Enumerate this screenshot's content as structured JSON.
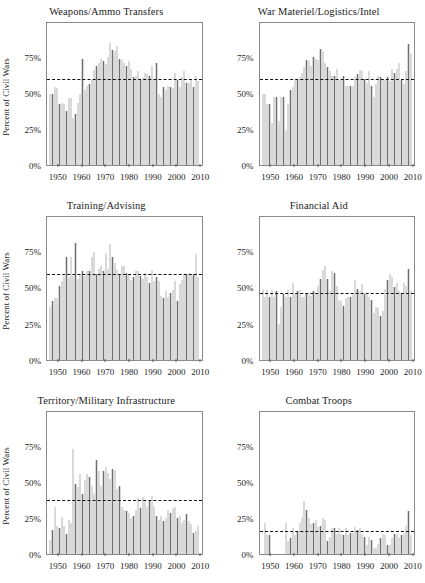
{
  "figure": {
    "ylabel": "Percent of Civil Wars",
    "ytick_labels": [
      "0%",
      "25%",
      "50%",
      "75%"
    ],
    "ytick_values": [
      0,
      25,
      50,
      75
    ],
    "xtick_labels": [
      "1950",
      "1960",
      "1970",
      "1980",
      "1990",
      "2000",
      "2010"
    ],
    "xtick_values": [
      1950,
      1960,
      1970,
      1980,
      1990,
      2000,
      2010
    ],
    "bar_color": "#6e6e6e",
    "mean_line_color": "#111111",
    "frame_color": "#8a8a8a",
    "ylim": [
      0,
      100
    ],
    "xlim": [
      1945,
      2011
    ]
  },
  "chart_data": [
    {
      "type": "bar",
      "title": "Weapons/Ammo Transfers",
      "xlabel": "",
      "ylabel": "Percent of Civil Wars",
      "ylim": [
        0,
        100
      ],
      "grid": false,
      "legend": "none",
      "mean_value": 61,
      "annotation": "dashed horizontal line at mean",
      "x": [
        1946,
        1947,
        1948,
        1949,
        1950,
        1951,
        1952,
        1953,
        1954,
        1955,
        1956,
        1957,
        1958,
        1959,
        1960,
        1961,
        1962,
        1963,
        1964,
        1965,
        1966,
        1967,
        1968,
        1969,
        1970,
        1971,
        1972,
        1973,
        1974,
        1975,
        1976,
        1977,
        1978,
        1979,
        1980,
        1981,
        1982,
        1983,
        1984,
        1985,
        1986,
        1987,
        1988,
        1989,
        1990,
        1991,
        1992,
        1993,
        1994,
        1995,
        1996,
        1997,
        1998,
        1999,
        2000,
        2001,
        2002,
        2003,
        2004,
        2005,
        2006,
        2007,
        2008,
        2009,
        2010
      ],
      "values": [
        50,
        50,
        55,
        54,
        43,
        44,
        43,
        38,
        47,
        47,
        33,
        36,
        44,
        50,
        75,
        53,
        56,
        57,
        60,
        67,
        70,
        72,
        75,
        73,
        71,
        76,
        86,
        81,
        80,
        84,
        75,
        74,
        72,
        70,
        73,
        68,
        62,
        63,
        66,
        60,
        62,
        65,
        64,
        63,
        70,
        60,
        72,
        50,
        48,
        55,
        53,
        56,
        55,
        54,
        65,
        60,
        55,
        62,
        66,
        58,
        58,
        60,
        55,
        63,
        59
      ]
    },
    {
      "type": "bar",
      "title": "War Materiel/Logistics/Intel",
      "xlabel": "",
      "ylabel": "",
      "ylim": [
        0,
        100
      ],
      "grid": false,
      "legend": "none",
      "mean_value": 61,
      "annotation": "dashed horizontal line at mean",
      "x": [
        1946,
        1947,
        1948,
        1949,
        1950,
        1951,
        1952,
        1953,
        1954,
        1955,
        1956,
        1957,
        1958,
        1959,
        1960,
        1961,
        1962,
        1963,
        1964,
        1965,
        1966,
        1967,
        1968,
        1969,
        1970,
        1971,
        1972,
        1973,
        1974,
        1975,
        1976,
        1977,
        1978,
        1979,
        1980,
        1981,
        1982,
        1983,
        1984,
        1985,
        1986,
        1987,
        1988,
        1989,
        1990,
        1991,
        1992,
        1993,
        1994,
        1995,
        1996,
        1997,
        1998,
        1999,
        2000,
        2001,
        2002,
        2003,
        2004,
        2005,
        2006,
        2007,
        2008,
        2009,
        2010
      ],
      "values": [
        50,
        50,
        43,
        43,
        30,
        48,
        48,
        31,
        48,
        48,
        25,
        43,
        53,
        55,
        60,
        60,
        62,
        65,
        69,
        74,
        73,
        70,
        76,
        75,
        74,
        82,
        80,
        72,
        69,
        66,
        63,
        63,
        68,
        60,
        60,
        63,
        56,
        56,
        56,
        56,
        62,
        64,
        67,
        66,
        61,
        58,
        66,
        56,
        48,
        57,
        63,
        62,
        60,
        60,
        62,
        59,
        68,
        65,
        68,
        72,
        60,
        57,
        66,
        85,
        79
      ]
    },
    {
      "type": "bar",
      "title": "Training/Advising",
      "xlabel": "",
      "ylabel": "Percent of Civil Wars",
      "ylim": [
        0,
        100
      ],
      "grid": false,
      "legend": "none",
      "mean_value": 60,
      "annotation": "dashed horizontal line at mean",
      "x": [
        1946,
        1947,
        1948,
        1949,
        1950,
        1951,
        1952,
        1953,
        1954,
        1955,
        1956,
        1957,
        1958,
        1959,
        1960,
        1961,
        1962,
        1963,
        1964,
        1965,
        1966,
        1967,
        1968,
        1969,
        1970,
        1971,
        1972,
        1973,
        1974,
        1975,
        1976,
        1977,
        1978,
        1979,
        1980,
        1981,
        1982,
        1983,
        1984,
        1985,
        1986,
        1987,
        1988,
        1989,
        1990,
        1991,
        1992,
        1993,
        1994,
        1995,
        1996,
        1997,
        1998,
        1999,
        2000,
        2001,
        2002,
        2003,
        2004,
        2005,
        2006,
        2007,
        2008,
        2009,
        2010
      ],
      "values": [
        37,
        41,
        43,
        43,
        52,
        55,
        59,
        72,
        58,
        72,
        59,
        82,
        57,
        60,
        62,
        59,
        62,
        62,
        72,
        76,
        60,
        64,
        66,
        62,
        75,
        64,
        81,
        72,
        68,
        63,
        60,
        66,
        66,
        61,
        60,
        56,
        58,
        62,
        62,
        59,
        57,
        61,
        58,
        54,
        63,
        55,
        58,
        55,
        45,
        43,
        48,
        44,
        47,
        49,
        55,
        41,
        53,
        56,
        60,
        60,
        61,
        60,
        60,
        74,
        58
      ]
    },
    {
      "type": "bar",
      "title": "Financial Aid",
      "xlabel": "",
      "ylabel": "",
      "ylim": [
        0,
        100
      ],
      "grid": false,
      "legend": "none",
      "mean_value": 47,
      "annotation": "dashed horizontal line at mean",
      "x": [
        1946,
        1947,
        1948,
        1949,
        1950,
        1951,
        1952,
        1953,
        1954,
        1955,
        1956,
        1957,
        1958,
        1959,
        1960,
        1961,
        1962,
        1963,
        1964,
        1965,
        1966,
        1967,
        1968,
        1969,
        1970,
        1971,
        1972,
        1973,
        1974,
        1975,
        1976,
        1977,
        1978,
        1979,
        1980,
        1981,
        1982,
        1983,
        1984,
        1985,
        1986,
        1987,
        1988,
        1989,
        1990,
        1991,
        1992,
        1993,
        1994,
        1995,
        1996,
        1997,
        1998,
        1999,
        2000,
        2001,
        2002,
        2003,
        2004,
        2005,
        2006,
        2007,
        2008,
        2009,
        2010
      ],
      "values": [
        49,
        44,
        49,
        44,
        49,
        44,
        48,
        25,
        37,
        46,
        44,
        49,
        44,
        54,
        46,
        48,
        49,
        44,
        44,
        46,
        46,
        45,
        48,
        47,
        52,
        57,
        63,
        66,
        57,
        48,
        62,
        61,
        52,
        42,
        41,
        38,
        43,
        44,
        44,
        46,
        56,
        50,
        48,
        53,
        46,
        46,
        44,
        42,
        33,
        37,
        36,
        31,
        34,
        50,
        56,
        60,
        58,
        51,
        54,
        48,
        47,
        54,
        52,
        64,
        48
      ]
    },
    {
      "type": "bar",
      "title": "Territory/Military Infrastructure",
      "xlabel": "",
      "ylabel": "Percent of Civil Wars",
      "ylim": [
        0,
        100
      ],
      "grid": false,
      "legend": "none",
      "mean_value": 38,
      "annotation": "dashed horizontal line at mean",
      "x": [
        1946,
        1947,
        1948,
        1949,
        1950,
        1951,
        1952,
        1953,
        1954,
        1955,
        1956,
        1957,
        1958,
        1959,
        1960,
        1961,
        1962,
        1963,
        1964,
        1965,
        1966,
        1967,
        1968,
        1969,
        1970,
        1971,
        1972,
        1973,
        1974,
        1975,
        1976,
        1977,
        1978,
        1979,
        1980,
        1981,
        1982,
        1983,
        1984,
        1985,
        1986,
        1987,
        1988,
        1989,
        1990,
        1991,
        1992,
        1993,
        1994,
        1995,
        1996,
        1997,
        1998,
        1999,
        2000,
        2001,
        2002,
        2003,
        2004,
        2005,
        2006,
        2007,
        2008,
        2009,
        2010
      ],
      "values": [
        10,
        17,
        33,
        20,
        18,
        26,
        20,
        14,
        24,
        22,
        74,
        49,
        47,
        56,
        42,
        52,
        56,
        54,
        48,
        43,
        66,
        58,
        48,
        58,
        61,
        57,
        53,
        60,
        59,
        46,
        48,
        33,
        31,
        30,
        29,
        25,
        27,
        31,
        39,
        32,
        40,
        38,
        33,
        37,
        41,
        34,
        27,
        24,
        27,
        23,
        25,
        31,
        29,
        32,
        33,
        25,
        27,
        22,
        24,
        28,
        23,
        21,
        15,
        16,
        20
      ]
    },
    {
      "type": "bar",
      "title": "Combat Troops",
      "xlabel": "",
      "ylabel": "",
      "ylim": [
        0,
        100
      ],
      "grid": false,
      "legend": "none",
      "mean_value": 16,
      "annotation": "dashed horizontal line at mean",
      "x": [
        1946,
        1947,
        1948,
        1949,
        1950,
        1951,
        1952,
        1953,
        1954,
        1955,
        1956,
        1957,
        1958,
        1959,
        1960,
        1961,
        1962,
        1963,
        1964,
        1965,
        1966,
        1967,
        1968,
        1969,
        1970,
        1971,
        1972,
        1973,
        1974,
        1975,
        1976,
        1977,
        1978,
        1979,
        1980,
        1981,
        1982,
        1983,
        1984,
        1985,
        1986,
        1987,
        1988,
        1989,
        1990,
        1991,
        1992,
        1993,
        1994,
        1995,
        1996,
        1997,
        1998,
        1999,
        2000,
        2001,
        2002,
        2003,
        2004,
        2005,
        2006,
        2007,
        2008,
        2009,
        2010
      ],
      "values": [
        0,
        22,
        13,
        13,
        0,
        0,
        0,
        0,
        0,
        0,
        22,
        9,
        11,
        18,
        13,
        16,
        22,
        26,
        37,
        31,
        25,
        21,
        22,
        24,
        19,
        20,
        25,
        24,
        9,
        12,
        18,
        18,
        14,
        18,
        14,
        13,
        18,
        13,
        15,
        15,
        19,
        17,
        18,
        14,
        12,
        6,
        12,
        10,
        4,
        4,
        7,
        11,
        14,
        13,
        6,
        6,
        11,
        14,
        14,
        12,
        13,
        14,
        20,
        30,
        13
      ]
    }
  ]
}
